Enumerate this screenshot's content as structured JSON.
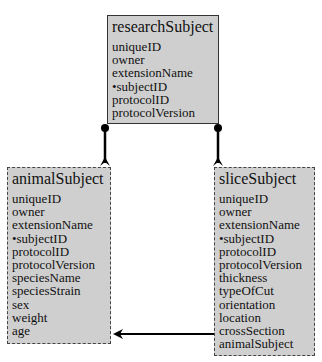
{
  "diagram": {
    "entities": [
      {
        "id": "researchSubject",
        "title": "researchSubject",
        "border": "solid",
        "fields": [
          "uniqueID",
          "owner",
          "extensionName",
          "•subjectID",
          "protocolID",
          "protocolVersion"
        ]
      },
      {
        "id": "animalSubject",
        "title": "animalSubject",
        "border": "dashed",
        "fields": [
          "uniqueID",
          "owner",
          "extensionName",
          "•subjectID",
          "protocolID",
          "protocolVersion",
          "speciesName",
          "speciesStrain",
          "sex",
          "weight",
          "age"
        ]
      },
      {
        "id": "sliceSubject",
        "title": "sliceSubject",
        "border": "dashed",
        "fields": [
          "uniqueID",
          "owner",
          "extensionName",
          "•subjectID",
          "protocolID",
          "protocolVersion",
          "thickness",
          "typeOfCut",
          "orientation",
          "location",
          "crossSection",
          "animalSubject"
        ]
      }
    ],
    "relationships": [
      {
        "from": "researchSubject",
        "to": "animalSubject",
        "type": "inheritance"
      },
      {
        "from": "researchSubject",
        "to": "sliceSubject",
        "type": "inheritance"
      },
      {
        "from": "sliceSubject",
        "to": "animalSubject",
        "type": "reference",
        "via_field": "animalSubject"
      }
    ],
    "colors": {
      "box_fill": "#cfcfcf",
      "border": "#333333",
      "line": "#000000"
    }
  }
}
